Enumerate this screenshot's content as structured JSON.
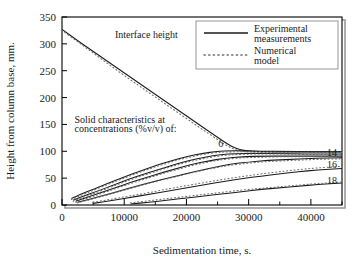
{
  "chart_data": {
    "type": "line",
    "title": "",
    "xlabel": "Sedimentation time, s.",
    "ylabel": "Height from column base, mm.",
    "xlim": [
      0,
      45000
    ],
    "ylim": [
      0,
      350
    ],
    "xticks": [
      "0",
      "10000",
      "20000",
      "30000",
      "40000"
    ],
    "xtick_values": [
      0,
      10000,
      20000,
      30000,
      40000
    ],
    "xminor_values": [
      5000,
      15000,
      25000,
      35000,
      45000
    ],
    "yticks": [
      "0",
      "50",
      "100",
      "150",
      "200",
      "250",
      "300",
      "350"
    ],
    "ytick_values": [
      0,
      50,
      100,
      150,
      200,
      250,
      300,
      350
    ],
    "grid": false,
    "legend": {
      "position": "top-right",
      "entries": [
        {
          "label_line1": "Experimental",
          "label_line2": "measurements",
          "style": "solid"
        },
        {
          "label_line1": "Numerical",
          "label_line2": "model",
          "style": "dotted"
        }
      ]
    },
    "annotations": [
      {
        "id": "interface-height",
        "text": "Interface height",
        "x": 8500,
        "y": 310
      },
      {
        "id": "solid-characteristics-line1",
        "text": "Solid characteristics at",
        "x": 2000,
        "y": 152
      },
      {
        "id": "solid-characteristics-line2",
        "text": "concentrations (%v/v) of:",
        "x": 2000,
        "y": 136
      }
    ],
    "curve_labels": [
      {
        "text": "6",
        "x": 25500,
        "y": 108
      },
      {
        "text": "14",
        "x": 44200,
        "y": 92
      },
      {
        "text": "16",
        "x": 44200,
        "y": 68
      },
      {
        "text": "18",
        "x": 44200,
        "y": 40
      }
    ],
    "series": [
      {
        "name": "Interface height (experimental)",
        "style": "solid",
        "points": [
          [
            0,
            327
          ],
          [
            2500,
            306
          ],
          [
            5000,
            286
          ],
          [
            7500,
            266
          ],
          [
            10000,
            246
          ],
          [
            12500,
            226
          ],
          [
            15000,
            206
          ],
          [
            17500,
            186
          ],
          [
            20000,
            166
          ],
          [
            22500,
            146
          ],
          [
            25000,
            126
          ],
          [
            26500,
            114
          ],
          [
            28000,
            105
          ],
          [
            29500,
            101
          ],
          [
            31000,
            100
          ],
          [
            34000,
            99
          ],
          [
            38000,
            99
          ],
          [
            42000,
            99
          ],
          [
            45000,
            99
          ]
        ]
      },
      {
        "name": "Interface height (numerical)",
        "style": "dotted",
        "points": [
          [
            0,
            325
          ],
          [
            2500,
            304
          ],
          [
            5000,
            283
          ],
          [
            7500,
            262
          ],
          [
            10000,
            241
          ],
          [
            12500,
            221
          ],
          [
            15000,
            201
          ],
          [
            17500,
            181
          ],
          [
            20000,
            161
          ],
          [
            22500,
            141
          ],
          [
            25000,
            122
          ],
          [
            26500,
            110
          ],
          [
            28000,
            102
          ],
          [
            29500,
            99
          ],
          [
            31000,
            98
          ],
          [
            34000,
            98
          ],
          [
            38000,
            98
          ],
          [
            42000,
            98
          ],
          [
            45000,
            98
          ]
        ]
      },
      {
        "name": "6 %v/v (experimental)",
        "style": "solid",
        "points": [
          [
            1500,
            12
          ],
          [
            3000,
            20
          ],
          [
            5000,
            29
          ],
          [
            7500,
            41
          ],
          [
            10000,
            52
          ],
          [
            12500,
            63
          ],
          [
            15000,
            73
          ],
          [
            17500,
            82
          ],
          [
            20000,
            90
          ],
          [
            22500,
            96
          ],
          [
            25000,
            100
          ],
          [
            27000,
            101
          ],
          [
            29000,
            101
          ],
          [
            32000,
            100
          ],
          [
            36000,
            100
          ],
          [
            40000,
            99
          ],
          [
            45000,
            99
          ]
        ]
      },
      {
        "name": "6 %v/v (numerical)",
        "style": "dotted",
        "points": [
          [
            1500,
            10
          ],
          [
            3000,
            18
          ],
          [
            5000,
            27
          ],
          [
            7500,
            39
          ],
          [
            10000,
            50
          ],
          [
            12500,
            61
          ],
          [
            15000,
            71
          ],
          [
            17500,
            80
          ],
          [
            20000,
            88
          ],
          [
            22500,
            94
          ],
          [
            25000,
            98
          ],
          [
            27000,
            99
          ],
          [
            29000,
            99
          ],
          [
            32000,
            99
          ],
          [
            36000,
            98
          ],
          [
            40000,
            98
          ],
          [
            45000,
            98
          ]
        ]
      },
      {
        "name": "10 %v/v (experimental)",
        "style": "solid",
        "points": [
          [
            1800,
            9
          ],
          [
            3500,
            17
          ],
          [
            5500,
            25
          ],
          [
            8000,
            36
          ],
          [
            10500,
            47
          ],
          [
            13000,
            57
          ],
          [
            15500,
            66
          ],
          [
            18000,
            75
          ],
          [
            20500,
            83
          ],
          [
            23000,
            89
          ],
          [
            25500,
            94
          ],
          [
            28000,
            96
          ],
          [
            31000,
            96
          ],
          [
            35000,
            96
          ],
          [
            39000,
            95
          ],
          [
            45000,
            95
          ]
        ]
      },
      {
        "name": "10 %v/v (numerical)",
        "style": "dotted",
        "points": [
          [
            1800,
            7
          ],
          [
            3500,
            15
          ],
          [
            5500,
            23
          ],
          [
            8000,
            34
          ],
          [
            10500,
            45
          ],
          [
            13000,
            55
          ],
          [
            15500,
            64
          ],
          [
            18000,
            73
          ],
          [
            20500,
            81
          ],
          [
            23000,
            87
          ],
          [
            25500,
            92
          ],
          [
            28000,
            94
          ],
          [
            31000,
            95
          ],
          [
            35000,
            95
          ],
          [
            39000,
            94
          ],
          [
            45000,
            94
          ]
        ]
      },
      {
        "name": "12 %v/v (experimental)",
        "style": "solid",
        "points": [
          [
            2200,
            7
          ],
          [
            4000,
            14
          ],
          [
            6000,
            22
          ],
          [
            8500,
            32
          ],
          [
            11000,
            42
          ],
          [
            13500,
            51
          ],
          [
            16000,
            60
          ],
          [
            18500,
            68
          ],
          [
            21000,
            76
          ],
          [
            23500,
            82
          ],
          [
            26000,
            87
          ],
          [
            29000,
            90
          ],
          [
            32000,
            91
          ],
          [
            36000,
            91
          ],
          [
            40000,
            91
          ],
          [
            45000,
            91
          ]
        ]
      },
      {
        "name": "12 %v/v (numerical)",
        "style": "dotted",
        "points": [
          [
            2200,
            5
          ],
          [
            4000,
            12
          ],
          [
            6000,
            20
          ],
          [
            8500,
            30
          ],
          [
            11000,
            40
          ],
          [
            13500,
            49
          ],
          [
            16000,
            58
          ],
          [
            18500,
            66
          ],
          [
            21000,
            74
          ],
          [
            23500,
            80
          ],
          [
            26000,
            85
          ],
          [
            29000,
            88
          ],
          [
            32000,
            89
          ],
          [
            36000,
            90
          ],
          [
            40000,
            90
          ],
          [
            45000,
            90
          ]
        ]
      },
      {
        "name": "14 %v/v (experimental)",
        "style": "solid",
        "points": [
          [
            2500,
            5
          ],
          [
            4500,
            11
          ],
          [
            7000,
            19
          ],
          [
            9500,
            27
          ],
          [
            12000,
            35
          ],
          [
            14500,
            43
          ],
          [
            17000,
            50
          ],
          [
            19500,
            57
          ],
          [
            22000,
            64
          ],
          [
            24500,
            70
          ],
          [
            27000,
            76
          ],
          [
            30000,
            80
          ],
          [
            33000,
            83
          ],
          [
            37000,
            85
          ],
          [
            41000,
            87
          ],
          [
            45000,
            88
          ]
        ]
      },
      {
        "name": "14 %v/v (numerical)",
        "style": "dotted",
        "points": [
          [
            2500,
            4
          ],
          [
            4500,
            10
          ],
          [
            7000,
            18
          ],
          [
            9500,
            26
          ],
          [
            12000,
            34
          ],
          [
            14500,
            42
          ],
          [
            17000,
            49
          ],
          [
            19500,
            56
          ],
          [
            22000,
            63
          ],
          [
            24500,
            69
          ],
          [
            27000,
            74
          ],
          [
            30000,
            78
          ],
          [
            33000,
            81
          ],
          [
            37000,
            83
          ],
          [
            41000,
            85
          ],
          [
            45000,
            86
          ]
        ]
      },
      {
        "name": "16 %v/v (experimental)",
        "style": "solid",
        "points": [
          [
            5000,
            3
          ],
          [
            8000,
            8
          ],
          [
            11000,
            14
          ],
          [
            14000,
            20
          ],
          [
            17000,
            26
          ],
          [
            20000,
            32
          ],
          [
            23000,
            38
          ],
          [
            26000,
            44
          ],
          [
            29000,
            49
          ],
          [
            32000,
            54
          ],
          [
            35000,
            58
          ],
          [
            38000,
            62
          ],
          [
            41000,
            65
          ],
          [
            45000,
            68
          ]
        ]
      },
      {
        "name": "16 %v/v (numerical)",
        "style": "dotted",
        "points": [
          [
            5000,
            5
          ],
          [
            8000,
            11
          ],
          [
            11000,
            17
          ],
          [
            14000,
            23
          ],
          [
            17000,
            30
          ],
          [
            20000,
            36
          ],
          [
            23000,
            42
          ],
          [
            26000,
            48
          ],
          [
            29000,
            53
          ],
          [
            32000,
            58
          ],
          [
            35000,
            62
          ],
          [
            38000,
            66
          ],
          [
            41000,
            69
          ],
          [
            45000,
            72
          ]
        ]
      },
      {
        "name": "18 %v/v (experimental)",
        "style": "solid",
        "points": [
          [
            11000,
            2
          ],
          [
            14000,
            5
          ],
          [
            17000,
            9
          ],
          [
            20000,
            13
          ],
          [
            23000,
            17
          ],
          [
            26000,
            21
          ],
          [
            29000,
            25
          ],
          [
            32000,
            29
          ],
          [
            35000,
            32
          ],
          [
            38000,
            35
          ],
          [
            41000,
            38
          ],
          [
            45000,
            41
          ]
        ]
      },
      {
        "name": "18 %v/v (numerical)",
        "style": "dotted",
        "points": [
          [
            11000,
            4
          ],
          [
            14000,
            8
          ],
          [
            17000,
            12
          ],
          [
            20000,
            16
          ],
          [
            23000,
            20
          ],
          [
            26000,
            24
          ],
          [
            29000,
            28
          ],
          [
            32000,
            31
          ],
          [
            35000,
            34
          ],
          [
            38000,
            37
          ],
          [
            41000,
            40
          ],
          [
            45000,
            43
          ]
        ]
      }
    ]
  },
  "colors": {
    "line": "#1a1a1a",
    "frame": "#000000",
    "shadow": "#999999",
    "background": "#ffffff"
  }
}
